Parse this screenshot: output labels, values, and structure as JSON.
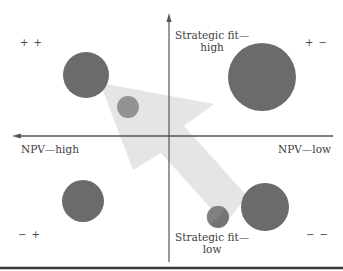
{
  "diagram": {
    "type": "portfolio-bubble-matrix",
    "axes": {
      "vertical": {
        "top_label_line1": "Strategic fit—",
        "top_label_line2": "high",
        "bottom_label_line1": "Strategic fit—",
        "bottom_label_line2": "low"
      },
      "horizontal": {
        "left_label": "NPV—high",
        "right_label": "NPV—low"
      }
    },
    "quadrants": {
      "top_left": "+ +",
      "top_right": "+ −",
      "bottom_left": "− +",
      "bottom_right": "− −"
    },
    "bubbles": [
      {
        "id": "large-top-left",
        "cx": 86,
        "cy": 75,
        "r": 23,
        "color": "#6b6b6b"
      },
      {
        "id": "large-top-right",
        "cx": 262,
        "cy": 77,
        "r": 34,
        "color": "#6b6b6b"
      },
      {
        "id": "small-top-left",
        "cx": 128,
        "cy": 107,
        "r": 11,
        "color": "#8d8d8d"
      },
      {
        "id": "large-bottom-left",
        "cx": 83,
        "cy": 201,
        "r": 21,
        "color": "#6b6b6b"
      },
      {
        "id": "large-bottom-right",
        "cx": 265,
        "cy": 207,
        "r": 24,
        "color": "#6b6b6b"
      },
      {
        "id": "small-bottom-right",
        "cx": 218,
        "cy": 217,
        "r": 11,
        "color": "#777777"
      }
    ],
    "arrow": {
      "direction": "from bottom-right toward top-left",
      "color": "#e3e3e3"
    },
    "colors": {
      "axis": "#555555",
      "bubble_dark": "#6b6b6b",
      "bubble_light": "#8d8d8d",
      "arrow_fill": "#e3e3e3",
      "rule": "#3a3a3a"
    }
  }
}
